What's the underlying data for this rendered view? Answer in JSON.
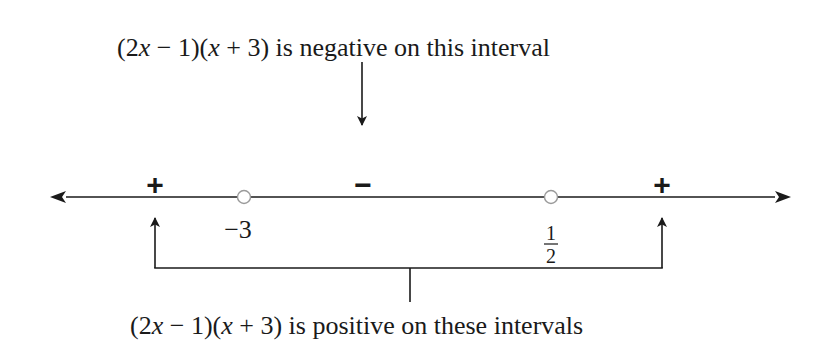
{
  "diagram": {
    "type": "sign-chart-number-line",
    "expression": "(2x − 1)(x + 3)",
    "top_label": {
      "prefix": "(2",
      "x1": "x",
      "mid": " − 1)(",
      "x2": "x",
      "suffix": " + 3) is negative on this interval",
      "full": "(2x − 1)(x + 3) is negative on this interval"
    },
    "bottom_label": {
      "prefix": "(2",
      "x1": "x",
      "mid": " − 1)(",
      "x2": "x",
      "suffix": " + 3) is positive on these intervals",
      "full": "(2x − 1)(x + 3) is positive on these intervals"
    },
    "signs": [
      {
        "interval": "(−∞, −3)",
        "sign": "+"
      },
      {
        "interval": "(−3, 1/2)",
        "sign": "−"
      },
      {
        "interval": "(1/2, ∞)",
        "sign": "+"
      }
    ],
    "critical_points": [
      {
        "value": "−3",
        "label": "−3",
        "marker": "open-circle"
      },
      {
        "value": "1/2",
        "numerator": "1",
        "denominator": "2",
        "marker": "open-circle"
      }
    ],
    "colors": {
      "line": "#1a1a1a",
      "text": "#1a1a1a",
      "open_circle": "#9a9a9a"
    }
  }
}
